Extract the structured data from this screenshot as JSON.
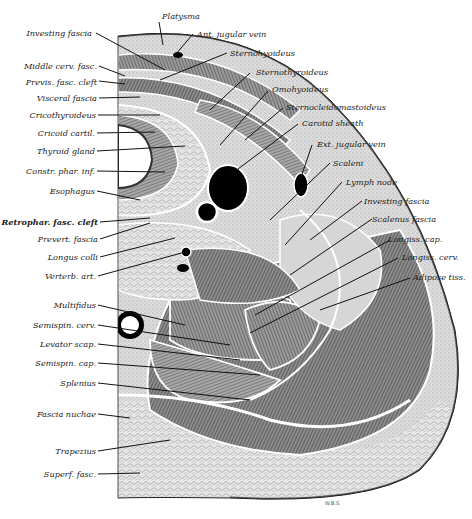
{
  "figure": {
    "signature": "W.B.S.",
    "colors": {
      "ink": "#1a1a1a",
      "paper": "#ffffff",
      "tissue_light": "#d9d9d9",
      "tissue_mid": "#9a9a9a",
      "tissue_dark": "#4a4a4a",
      "vessel": "#000000"
    },
    "labels_left": [
      {
        "text": "Investing fascia"
      },
      {
        "text": "Middle cerv. fasc."
      },
      {
        "text": "Previs. fasc. cleft"
      },
      {
        "text": "Visceral fascia"
      },
      {
        "text": "Cricothyroideus"
      },
      {
        "text": "Cricoid cartil."
      },
      {
        "text": "Thyroid gland"
      },
      {
        "text": "Constr. phar. inf."
      },
      {
        "text": "Esophagus"
      },
      {
        "text": "Retrophar. fasc. cleft"
      },
      {
        "text": "Prevert. fascia"
      },
      {
        "text": "Longus colli"
      },
      {
        "text": "Verterb. art."
      },
      {
        "text": "Multifidus"
      },
      {
        "text": "Semispin. cerv."
      },
      {
        "text": "Levator scap."
      },
      {
        "text": "Semispin. cap."
      },
      {
        "text": "Splenius"
      },
      {
        "text": "Fascia nuchae"
      },
      {
        "text": "Trapezius"
      },
      {
        "text": "Superf. fasc."
      }
    ],
    "labels_right": [
      {
        "text": "Platysma"
      },
      {
        "text": "Ant. jugular vein"
      },
      {
        "text": "Sternohyoideus"
      },
      {
        "text": "Sternothyroideus"
      },
      {
        "text": "Omohyoideus"
      },
      {
        "text": "Sternocleidomastoideus"
      },
      {
        "text": "Carotid sheath"
      },
      {
        "text": "Ext. jugular vein"
      },
      {
        "text": "Scaleni"
      },
      {
        "text": "Lymph node"
      },
      {
        "text": "Investing fascia"
      },
      {
        "text": "Scalenus fascia"
      },
      {
        "text": "Longiss. cap."
      },
      {
        "text": "Longiss. cerv."
      },
      {
        "text": "Adipose tiss."
      }
    ]
  }
}
